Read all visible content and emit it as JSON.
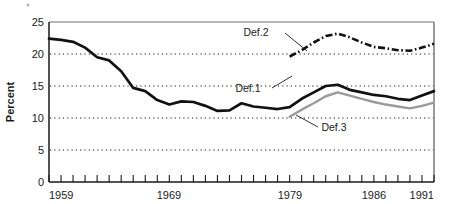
{
  "chart_data": {
    "type": "line",
    "title": "",
    "xlabel": "",
    "ylabel": "Percent",
    "xlim": [
      1959,
      1991
    ],
    "ylim": [
      0,
      25
    ],
    "ytick_labels": [
      "0",
      "5",
      "10",
      "15",
      "20",
      "25"
    ],
    "ytick_values": [
      0,
      5,
      10,
      15,
      20,
      25
    ],
    "xtick_labels": [
      "1959",
      "1969",
      "1979",
      "1986",
      "1991"
    ],
    "xtick_values": [
      1959,
      1969,
      1979,
      1986,
      1991
    ],
    "xtick_minor_step": 1,
    "grid": "horizontal-dotted",
    "legend_position": "inline-annotations",
    "series": [
      {
        "name": "Def.1",
        "style": "solid-thick-black",
        "color": "#111111",
        "x": [
          1959,
          1960,
          1961,
          1962,
          1963,
          1964,
          1965,
          1966,
          1967,
          1968,
          1969,
          1970,
          1971,
          1972,
          1973,
          1974,
          1975,
          1976,
          1977,
          1978,
          1979,
          1980,
          1981,
          1982,
          1983,
          1984,
          1985,
          1986,
          1987,
          1988,
          1989,
          1990,
          1991
        ],
        "values": [
          22.4,
          22.2,
          21.9,
          21.0,
          19.5,
          19.0,
          17.3,
          14.7,
          14.2,
          12.8,
          12.1,
          12.6,
          12.5,
          11.9,
          11.1,
          11.2,
          12.3,
          11.8,
          11.6,
          11.4,
          11.7,
          13.0,
          14.0,
          15.0,
          15.2,
          14.4,
          14.0,
          13.6,
          13.4,
          13.0,
          12.8,
          13.5,
          14.2
        ]
      },
      {
        "name": "Def.2",
        "style": "dash-dot-black",
        "color": "#111111",
        "x": [
          1979,
          1980,
          1981,
          1982,
          1983,
          1984,
          1985,
          1986,
          1987,
          1988,
          1989,
          1990,
          1991
        ],
        "values": [
          19.6,
          20.6,
          21.8,
          22.8,
          23.2,
          22.6,
          21.8,
          21.1,
          20.9,
          20.6,
          20.5,
          21.0,
          21.6
        ]
      },
      {
        "name": "Def.3",
        "style": "solid-gray",
        "color": "#9a9a9a",
        "x": [
          1979,
          1980,
          1981,
          1982,
          1983,
          1984,
          1985,
          1986,
          1987,
          1988,
          1989,
          1990,
          1991
        ],
        "values": [
          10.2,
          11.3,
          12.3,
          13.4,
          14.0,
          13.5,
          13.0,
          12.5,
          12.1,
          11.8,
          11.5,
          11.9,
          12.4
        ]
      }
    ],
    "annotations": [
      {
        "label": "Def.2",
        "x_px": 258,
        "y_px": 36
      },
      {
        "label": "Def.1",
        "x_px": 246,
        "y_px": 92
      },
      {
        "label": "Def.3",
        "x_px": 322,
        "y_px": 129
      }
    ]
  }
}
